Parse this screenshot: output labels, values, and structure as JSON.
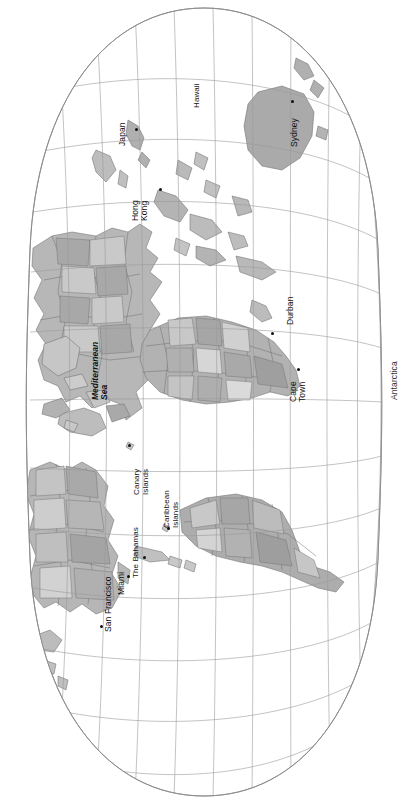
{
  "map": {
    "title": "World Map",
    "projection": "robinson-oval",
    "rotation_deg": 90,
    "orientation_note": "map rotated 90 degrees; labels read bottom-to-top",
    "background_color": "#ffffff",
    "graticule_color": "#9a9a9a",
    "outline_color": "#8a8a8a",
    "land_colors": [
      "#b4b4b4",
      "#bdbdbd",
      "#a8a8a8",
      "#c6c6c6",
      "#d2d2d2",
      "#9e9e9e",
      "#dcdcdc"
    ],
    "ocean_color": "#ffffff",
    "graticule": {
      "meridian_count": 13,
      "parallel_count": 9,
      "visible": true
    },
    "labels": [
      {
        "id": "hawaii",
        "text": "Hawaii",
        "kind": "region",
        "lines": [
          "Hawaii"
        ],
        "x": 192,
        "y": 108,
        "dot": false
      },
      {
        "id": "japan",
        "text": "Japan",
        "kind": "city",
        "lines": [
          "Japan"
        ],
        "x": 118,
        "y": 146,
        "dot": true,
        "dot_x": 135,
        "dot_y": 128
      },
      {
        "id": "sydney",
        "text": "Sydney",
        "kind": "city",
        "lines": [
          "Sydney"
        ],
        "x": 290,
        "y": 147,
        "dot": true,
        "dot_x": 291,
        "dot_y": 100
      },
      {
        "id": "hong-kong",
        "text": "Hong Kong",
        "kind": "city",
        "lines": [
          "Hong",
          "Kong"
        ],
        "x": 131,
        "y": 221,
        "dot": true,
        "dot_x": 159,
        "dot_y": 188
      },
      {
        "id": "durban",
        "text": "Durban",
        "kind": "city",
        "lines": [
          "Durban"
        ],
        "x": 286,
        "y": 325,
        "dot": true,
        "dot_x": 271,
        "dot_y": 332
      },
      {
        "id": "cape-town",
        "text": "Cape Town",
        "kind": "city",
        "lines": [
          "Cape",
          "Town"
        ],
        "x": 289,
        "y": 402,
        "dot": true,
        "dot_x": 297,
        "dot_y": 368
      },
      {
        "id": "mediterranean-sea",
        "text": "Mediterranean Sea",
        "kind": "sea",
        "lines": [
          "Mediterranean",
          "Sea"
        ],
        "x": 91,
        "y": 400,
        "dot": false
      },
      {
        "id": "antarctica",
        "text": "Antarctica",
        "kind": "polar",
        "lines": [
          "Antarctica"
        ],
        "x": 390,
        "y": 400,
        "dot": false
      },
      {
        "id": "canary-islands",
        "text": "Canary Islands",
        "kind": "region",
        "lines": [
          "Canary",
          "Islands"
        ],
        "x": 132,
        "y": 495,
        "dot": true,
        "dot_x": 128,
        "dot_y": 444
      },
      {
        "id": "caribbean-islands",
        "text": "Caribbean Islands",
        "kind": "region",
        "lines": [
          "Caribbean",
          "Islands"
        ],
        "x": 162,
        "y": 528,
        "dot": true,
        "dot_x": 167,
        "dot_y": 527
      },
      {
        "id": "the-bahamas",
        "text": "The Bahamas",
        "kind": "region",
        "lines": [
          "The Bahamas"
        ],
        "x": 131,
        "y": 578,
        "dot": true,
        "dot_x": 143,
        "dot_y": 556
      },
      {
        "id": "miami",
        "text": "Miami",
        "kind": "city",
        "lines": [
          "Miami"
        ],
        "x": 117,
        "y": 595,
        "dot": true,
        "dot_x": 127,
        "dot_y": 575
      },
      {
        "id": "san-francisco",
        "text": "San Francisco",
        "kind": "city",
        "lines": [
          "San Francisco"
        ],
        "x": 104,
        "y": 632,
        "dot": true,
        "dot_x": 100,
        "dot_y": 625
      }
    ]
  }
}
